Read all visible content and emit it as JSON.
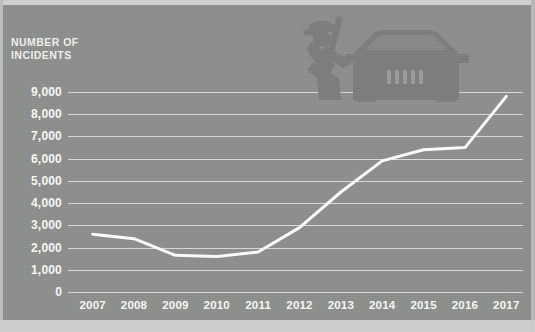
{
  "colors": {
    "background": "#8e918e",
    "gridline": "#e9ebe9",
    "text": "#fbfcfb",
    "line": "#ffffff",
    "illustration": "#7b7e7b",
    "paper_margin": "#d2d4d2"
  },
  "axis_title": "NUMBER OF\nINCIDENTS",
  "illustration": {
    "name": "car-break-in-silhouette",
    "description": "silhouette of a person prying open a car"
  },
  "chart_data": {
    "type": "line",
    "title": "",
    "subtitle": "",
    "xlabel": "",
    "ylabel": "NUMBER OF INCIDENTS",
    "categories": [
      "2007",
      "2008",
      "2009",
      "2010",
      "2011",
      "2012",
      "2013",
      "2014",
      "2015",
      "2016",
      "2017"
    ],
    "values": [
      2600,
      2400,
      1650,
      1600,
      1800,
      2900,
      4500,
      5900,
      6400,
      6500,
      8800
    ],
    "series": [
      {
        "name": "Incidents",
        "color": "#ffffff",
        "values": [
          2600,
          2400,
          1650,
          1600,
          1800,
          2900,
          4500,
          5900,
          6400,
          6500,
          8800
        ]
      }
    ],
    "ylim": [
      0,
      9000
    ],
    "ytick_values": [
      0,
      1000,
      2000,
      3000,
      4000,
      5000,
      6000,
      7000,
      8000,
      9000
    ],
    "ytick_labels": [
      "0",
      "1,000",
      "2,000",
      "3,000",
      "4,000",
      "5,000",
      "6,000",
      "7,000",
      "8,000",
      "9,000"
    ],
    "xtick_labels": [
      "2007",
      "2008",
      "2009",
      "2010",
      "2011",
      "2012",
      "2013",
      "2014",
      "2015",
      "2016",
      "2017"
    ],
    "grid": true,
    "grid_axis": "y",
    "legend": false,
    "legend_position": "none",
    "markers": false,
    "line_width": 3
  }
}
